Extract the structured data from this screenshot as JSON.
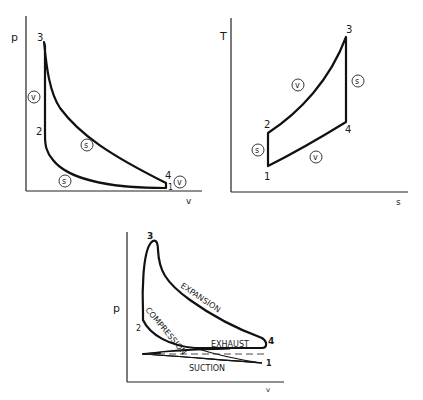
{
  "diagrams": {
    "pv": {
      "y_axis": "p",
      "x_axis": "v",
      "points": {
        "p1": "1",
        "p2": "2",
        "p3": "3",
        "p4": "4"
      },
      "process_marks": {
        "v_left": "v",
        "s_upper": "s",
        "s_lower": "s",
        "v_right": "v"
      }
    },
    "ts": {
      "y_axis": "T",
      "x_axis": "s",
      "points": {
        "p1": "1",
        "p2": "2",
        "p3": "3",
        "p4": "4"
      },
      "process_marks": {
        "s_left": "s",
        "v_upper": "v",
        "s_right": "s",
        "v_lower": "v"
      }
    },
    "indicator": {
      "y_axis": "p",
      "x_axis": "v",
      "points": {
        "p1": "1",
        "p2": "2",
        "p3": "3",
        "p4": "4"
      },
      "strokes": {
        "expansion": "EXPANSION",
        "compression": "COMPRESSION",
        "exhaust": "EXHAUST",
        "suction": "SUCTION"
      }
    }
  }
}
